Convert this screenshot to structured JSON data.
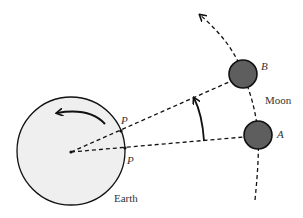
{
  "diagram": {
    "labels": {
      "earth": "Earth",
      "moon": "Moon",
      "point_a": "A",
      "point_b": "B",
      "observer_upper": "P",
      "observer_lower": "P"
    },
    "colors": {
      "earth_fill": "#efefef",
      "moon_fill": "#5e5e5e",
      "stroke": "#111111"
    }
  }
}
